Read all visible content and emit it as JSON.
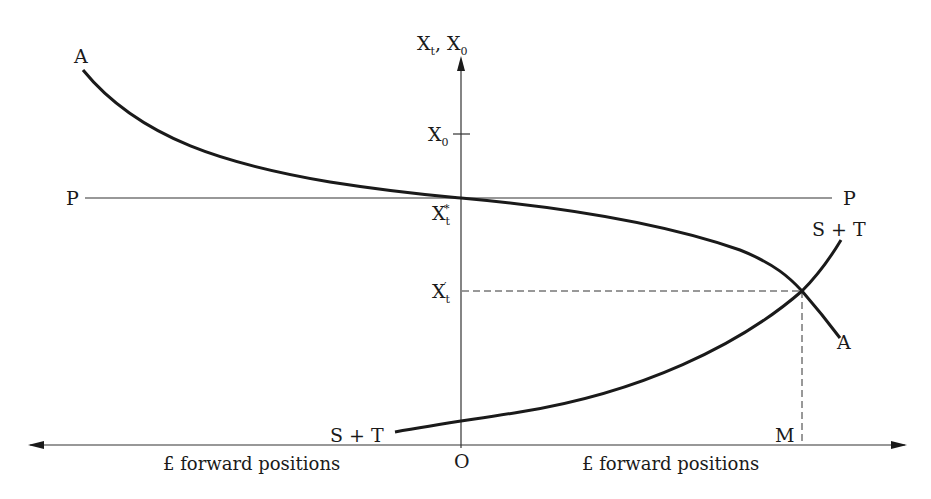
{
  "diagram": {
    "axes": {
      "y_axis_label_main": "X",
      "y_axis_label_sub1": "t",
      "y_axis_label_sep": ", X",
      "y_axis_label_sub2": "0",
      "origin_label": "O",
      "x_axis_left_label": "£ forward positions",
      "x_axis_right_label": "£ forward positions"
    },
    "y_ticks": {
      "x0": {
        "main": "X",
        "sub": "0"
      },
      "xt_star": {
        "main": "X",
        "sub": "t",
        "sup": "*"
      },
      "xt_prime": {
        "main": "X",
        "sub": "t",
        "sup": "′"
      }
    },
    "curves": {
      "a_curve_left_label": "A",
      "a_curve_right_label": "A",
      "p_line_left_label": "P",
      "p_line_right_label": "P",
      "st_curve_left_label": "S + T",
      "st_curve_right_label": "S + T"
    },
    "markers": {
      "m_label": "M"
    }
  }
}
